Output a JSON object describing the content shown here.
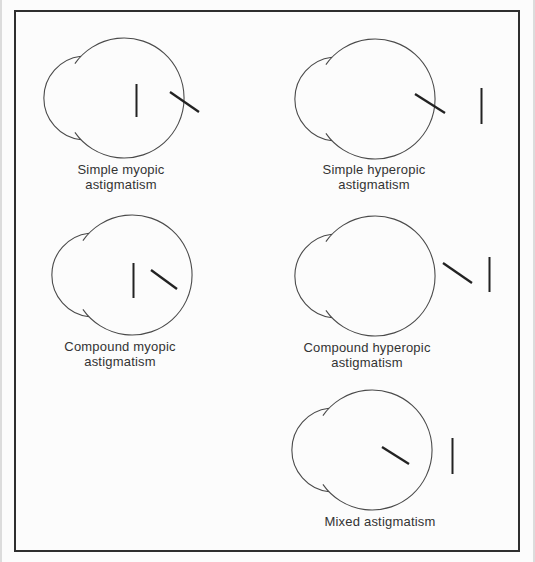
{
  "figure": {
    "background_color": "#fcfcfc",
    "border_color": "#2f2f2f",
    "eye_outline_color": "#4a4a4a",
    "focal_line_color": "#222222",
    "text_color": "#333333",
    "panels": [
      {
        "name": "simple-myopic-astigmatism",
        "label_line1": "Simple myopic",
        "label_line2": "astigmatism",
        "focal_lines": "vertical line inside eye, oblique line on retina"
      },
      {
        "name": "simple-hyperopic-astigmatism",
        "label_line1": "Simple hyperopic",
        "label_line2": "astigmatism",
        "focal_lines": "oblique line on retina, vertical line behind eye"
      },
      {
        "name": "compound-myopic-astigmatism",
        "label_line1": "Compound myopic",
        "label_line2": "astigmatism",
        "focal_lines": "vertical and oblique lines inside eye"
      },
      {
        "name": "compound-hyperopic-astigmatism",
        "label_line1": "Compound hyperopic",
        "label_line2": "astigmatism",
        "focal_lines": "oblique and vertical lines behind eye"
      },
      {
        "name": "mixed-astigmatism",
        "label_line1": "Mixed astigmatism",
        "label_line2": "",
        "focal_lines": "oblique line inside eye, vertical line behind eye"
      }
    ]
  }
}
